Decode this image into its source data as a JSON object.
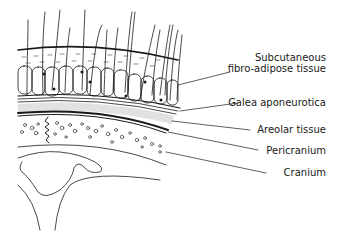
{
  "diagram": {
    "labels": [
      {
        "id": "subcutaneous",
        "line1": "Subcutaneous",
        "line2": "fibro-adipose tissue"
      },
      {
        "id": "galea",
        "text": "Galea aponeurotica"
      },
      {
        "id": "areolar",
        "text": "Areolar tissue"
      },
      {
        "id": "pericranium",
        "text": "Pericranium"
      },
      {
        "id": "cranium",
        "text": "Cranium"
      }
    ],
    "colors": {
      "line": "#1a1a1a",
      "background": "#ffffff"
    }
  }
}
